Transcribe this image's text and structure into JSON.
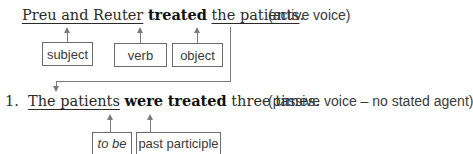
{
  "active": {
    "subject": "Preu and Reuter",
    "verb": "treated",
    "object": "the patients",
    "period": ".",
    "note": "(active voice)",
    "labels": {
      "subject": "subject",
      "verb": "verb",
      "object": "object"
    }
  },
  "passive": {
    "number": "1.",
    "subject": "The patients",
    "verb_to_be": "were",
    "verb_participle": "treated",
    "rest": "three times.",
    "note": "(passive voice – no stated agent)",
    "labels": {
      "to_be": "to be",
      "past_participle": "past participle"
    }
  }
}
